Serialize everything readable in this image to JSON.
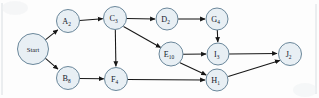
{
  "diagram": {
    "type": "activity-network-graph",
    "node_fill_color": "#e8eff4",
    "node_stroke_color": "#5b7a90",
    "edge_color": "#171717",
    "background_color": "#fdfdfd",
    "nodes": [
      {
        "id": "start",
        "label": "Start",
        "base": "Start",
        "sub": "",
        "cx": 33,
        "cy": 49,
        "r": 15.5
      },
      {
        "id": "a",
        "label": "A2",
        "base": "A",
        "sub": "2",
        "cx": 68,
        "cy": 21,
        "r": 11.5
      },
      {
        "id": "b",
        "label": "B8",
        "base": "B",
        "sub": "8",
        "cx": 68,
        "cy": 78,
        "r": 11.5
      },
      {
        "id": "c",
        "label": "C3",
        "base": "C",
        "sub": "3",
        "cx": 115,
        "cy": 18,
        "r": 11.5
      },
      {
        "id": "d",
        "label": "D2",
        "base": "D",
        "sub": "2",
        "cx": 167,
        "cy": 19,
        "r": 11.0
      },
      {
        "id": "g",
        "label": "G4",
        "base": "G",
        "sub": "4",
        "cx": 217,
        "cy": 19,
        "r": 11.0
      },
      {
        "id": "e",
        "label": "E10",
        "base": "E",
        "sub": "10",
        "cx": 171,
        "cy": 54,
        "r": 12.0
      },
      {
        "id": "i",
        "label": "I3",
        "base": "I",
        "sub": "3",
        "cx": 218,
        "cy": 54,
        "r": 11.0
      },
      {
        "id": "f",
        "label": "F4",
        "base": "F",
        "sub": "4",
        "cx": 116,
        "cy": 79,
        "r": 11.5
      },
      {
        "id": "h",
        "label": "H1",
        "base": "H",
        "sub": "1",
        "cx": 217,
        "cy": 80,
        "r": 11.0
      },
      {
        "id": "j",
        "label": "J2",
        "base": "J",
        "sub": "2",
        "cx": 290,
        "cy": 54,
        "r": 11.5
      }
    ],
    "edges": [
      {
        "from": "start",
        "to": "a",
        "label": ""
      },
      {
        "from": "start",
        "to": "b",
        "label": ""
      },
      {
        "from": "a",
        "to": "c",
        "label": ""
      },
      {
        "from": "c",
        "to": "d",
        "label": ""
      },
      {
        "from": "c",
        "to": "e",
        "label": ""
      },
      {
        "from": "c",
        "to": "f",
        "label": ""
      },
      {
        "from": "d",
        "to": "g",
        "label": ""
      },
      {
        "from": "g",
        "to": "i",
        "label": ""
      },
      {
        "from": "e",
        "to": "i",
        "label": ""
      },
      {
        "from": "e",
        "to": "h",
        "label": ""
      },
      {
        "from": "b",
        "to": "f",
        "label": ""
      },
      {
        "from": "f",
        "to": "h",
        "label": ""
      },
      {
        "from": "i",
        "to": "j",
        "label": ""
      },
      {
        "from": "h",
        "to": "j",
        "label": ""
      }
    ]
  }
}
